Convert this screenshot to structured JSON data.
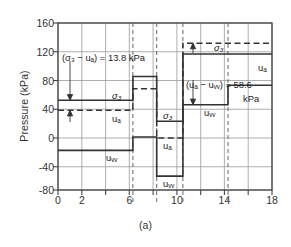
{
  "figure": {
    "caption": "(a)",
    "ylabel": "Pressure (kPa)",
    "yticks": [
      "160",
      "120",
      "80",
      "40",
      "0",
      "-40",
      "-80"
    ],
    "xticks": [
      "0",
      "2",
      "",
      "6",
      "",
      "10",
      "",
      "14",
      "",
      "18"
    ],
    "annotations": {
      "a1": "(σ₃ − uₐ) = 13.8  kPa",
      "a2": "(uₐ − uᵥᵥ) = 58.6",
      "a2_unit": "kPa"
    },
    "curve_labels": {
      "s3_left": "σ₃",
      "ua_left": "uₐ",
      "uw_left": "uᵥᵥ",
      "s3_mid": "σ₃",
      "ua_mid": "uₐ",
      "uw_mid": "uᵥᵥ",
      "s3_right": "σ₃",
      "ua_right": "uₐ",
      "uw_right": "uᵥᵥ"
    },
    "colors": {
      "line": "#333333",
      "grid": "#9a9a9a",
      "axis": "#555555"
    }
  },
  "chart_data": {
    "type": "line",
    "title": "",
    "xlabel": "",
    "ylabel": "Pressure (kPa)",
    "xlim": [
      0,
      18
    ],
    "ylim": [
      -80,
      160
    ],
    "xtick_values": [
      0,
      2,
      4,
      6,
      8,
      10,
      12,
      14,
      16,
      18
    ],
    "ytick_values": [
      -80,
      -40,
      0,
      40,
      80,
      120,
      160
    ],
    "grid": true,
    "legend": "inline-labels",
    "stage_boundaries": [
      6.3,
      8.3,
      10.5
    ],
    "series": [
      {
        "name": "σ₃",
        "style": "solid",
        "x": [
          0,
          6.3,
          6.3,
          8.3,
          8.3,
          10.5,
          10.5,
          18
        ],
        "values": [
          43,
          43,
          77,
          77,
          13,
          13,
          107,
          107
        ]
      },
      {
        "name": "uₐ",
        "style": "dashed",
        "x": [
          0,
          6.3,
          6.3,
          8.3,
          8.3,
          10.5,
          10.5,
          18
        ],
        "values": [
          29,
          29,
          60,
          60,
          0,
          0,
          93,
          93
        ]
      },
      {
        "name": "uᵥᵥ",
        "style": "solid",
        "x": [
          0,
          6.3,
          6.3,
          8.3,
          8.3,
          10.5,
          10.5,
          14.3,
          14.3,
          18
        ],
        "values": [
          -27,
          -27,
          5,
          5,
          -60,
          -60,
          35,
          35,
          62,
          62
        ]
      }
    ],
    "measured_differences": [
      {
        "label": "(σ₃ − uₐ)",
        "value": 13.8,
        "unit": "kPa"
      },
      {
        "label": "(uₐ − uᵥᵥ)",
        "value": 58.6,
        "unit": "kPa"
      }
    ]
  }
}
